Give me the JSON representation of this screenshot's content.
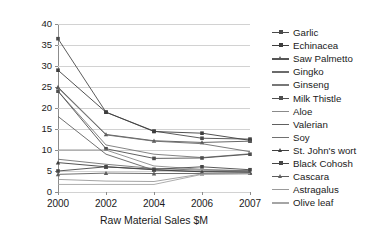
{
  "chart_data": {
    "type": "line",
    "title": "",
    "xlabel": "Raw Material Sales $M",
    "ylabel": "",
    "x": [
      "2000",
      "2002",
      "2004",
      "2006",
      "2007"
    ],
    "categories": [
      "2000",
      "2002",
      "2004",
      "2006",
      "2007"
    ],
    "ylim": [
      0,
      40
    ],
    "ytick_step": 5,
    "yticks": [
      "0",
      "5",
      "10",
      "15",
      "20",
      "25",
      "30",
      "35",
      "40"
    ],
    "grid": "horizontal",
    "legend_position": "right",
    "series": [
      {
        "name": "Garlic",
        "marker": "square",
        "color": "#4a4a4a",
        "values": [
          36.5,
          19.0,
          14.5,
          12.8,
          12.6
        ]
      },
      {
        "name": "Echinacea",
        "marker": "square",
        "color": "#3d3d3d",
        "values": [
          29.0,
          19.0,
          14.4,
          14.0,
          12.3
        ]
      },
      {
        "name": "Saw Palmetto",
        "marker": "triangle",
        "color": "#555555",
        "values": [
          25.0,
          13.7,
          12.2,
          11.8,
          12.1
        ]
      },
      {
        "name": "Gingko",
        "marker": "none",
        "color": "#6b6b6b",
        "values": [
          24.8,
          13.6,
          12.1,
          11.5,
          9.6
        ]
      },
      {
        "name": "Ginseng",
        "marker": "none",
        "color": "#777777",
        "values": [
          24.0,
          11.2,
          9.0,
          8.2,
          9.1
        ]
      },
      {
        "name": "Milk Thistle",
        "marker": "square",
        "color": "#4f4f4f",
        "values": [
          24.0,
          10.3,
          8.0,
          8.1,
          9.0
        ]
      },
      {
        "name": "Aloe",
        "marker": "none",
        "color": "#8a8a8a",
        "values": [
          10.0,
          10.0,
          6.2,
          5.4,
          5.0
        ]
      },
      {
        "name": "Valerian",
        "marker": "none",
        "color": "#606060",
        "values": [
          18.0,
          9.0,
          5.2,
          4.9,
          4.8
        ]
      },
      {
        "name": "Soy",
        "marker": "none",
        "color": "#707070",
        "values": [
          7.8,
          6.6,
          5.6,
          5.2,
          5.1
        ]
      },
      {
        "name": "St. John's wort",
        "marker": "triangle",
        "color": "#3f3f3f",
        "values": [
          7.0,
          6.0,
          5.3,
          4.8,
          4.7
        ]
      },
      {
        "name": "Black Cohosh",
        "marker": "square",
        "color": "#464646",
        "values": [
          5.0,
          6.0,
          5.4,
          6.0,
          5.3
        ]
      },
      {
        "name": "Cascara",
        "marker": "triangle",
        "color": "#5c5c5c",
        "values": [
          4.2,
          4.5,
          4.4,
          4.4,
          4.5
        ]
      },
      {
        "name": "Astragalus",
        "marker": "none",
        "color": "#9a9a9a",
        "values": [
          3.0,
          2.6,
          2.5,
          4.3,
          4.4
        ]
      },
      {
        "name": "Olive leaf",
        "marker": "none",
        "color": "#a5a5a5",
        "values": [
          1.8,
          1.8,
          1.8,
          4.2,
          4.3
        ]
      }
    ]
  },
  "legend": {
    "items": [
      {
        "label": "Garlic",
        "marker": "square"
      },
      {
        "label": "Echinacea",
        "marker": "square"
      },
      {
        "label": "Saw Palmetto",
        "marker": "triangle"
      },
      {
        "label": "Gingko",
        "marker": "none"
      },
      {
        "label": "Ginseng",
        "marker": "none"
      },
      {
        "label": "Milk Thistle",
        "marker": "square"
      },
      {
        "label": "Aloe",
        "marker": "none"
      },
      {
        "label": "Valerian",
        "marker": "none"
      },
      {
        "label": "Soy",
        "marker": "none"
      },
      {
        "label": "St. John's wort",
        "marker": "triangle"
      },
      {
        "label": "Black Cohosh",
        "marker": "square"
      },
      {
        "label": "Cascara",
        "marker": "triangle"
      },
      {
        "label": "Astragalus",
        "marker": "none"
      },
      {
        "label": "Olive leaf",
        "marker": "none"
      }
    ]
  },
  "colors": {
    "axis": "#8c8c8c",
    "grid": "#d2d2d2",
    "text": "#1a1a1a",
    "background": "#ffffff"
  }
}
